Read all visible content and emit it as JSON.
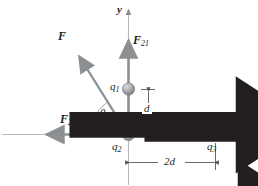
{
  "figure": {
    "colors": {
      "axis": "#b7b9bb",
      "vector": "#8d9093",
      "sphere_light": "#c9cbcd",
      "sphere_dark": "#77797c",
      "dimension": "#58595b",
      "text": "#231f20",
      "arc": "#a7a9ac"
    },
    "axes": {
      "x_label": "x",
      "y_label": "y"
    },
    "charges": [
      {
        "id": "q1",
        "label": "q",
        "sub": "1",
        "x": 128,
        "y": 89
      },
      {
        "id": "q2",
        "label": "q",
        "sub": "2",
        "x": 128,
        "y": 134
      },
      {
        "id": "q3",
        "label": "q",
        "sub": "3",
        "x": 214,
        "y": 134
      }
    ],
    "vectors": [
      {
        "id": "F21",
        "label": "F",
        "sub": "21",
        "direction": "up"
      },
      {
        "id": "F23",
        "label": "F",
        "sub": "23",
        "direction": "left"
      },
      {
        "id": "F",
        "label": "F",
        "sub": "",
        "direction": "up-left"
      }
    ],
    "angle": {
      "symbol": "θ"
    },
    "dimensions": [
      {
        "id": "d-vertical",
        "label": "d",
        "orientation": "vertical"
      },
      {
        "id": "2d-horizontal",
        "label": "2d",
        "orientation": "horizontal"
      }
    ]
  }
}
